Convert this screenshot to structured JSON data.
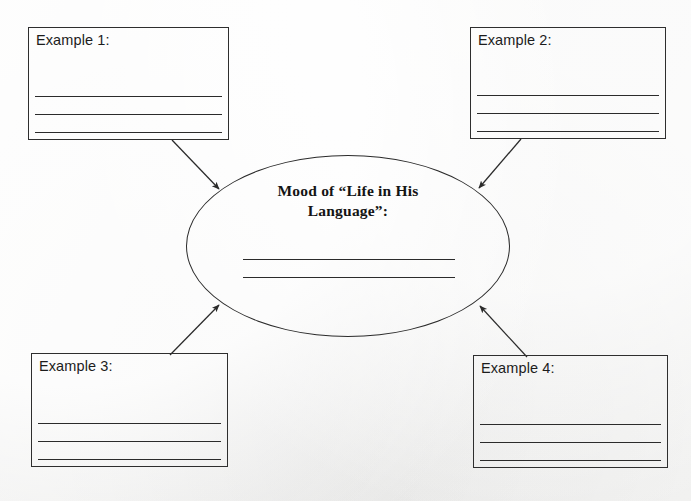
{
  "page": {
    "type": "graphic-organizer-worksheet",
    "background_color": "#f2f2f1",
    "ink_color": "#2b2b2b"
  },
  "center": {
    "shape": "ellipse",
    "title_line_1": "Mood of “Life in His",
    "title_line_2": "Language”:",
    "answer_line_count": 2
  },
  "boxes": [
    {
      "id": "example-1",
      "label": "Example 1:",
      "rule_line_count": 3
    },
    {
      "id": "example-2",
      "label": "Example 2:",
      "rule_line_count": 3
    },
    {
      "id": "example-3",
      "label": "Example 3:",
      "rule_line_count": 3
    },
    {
      "id": "example-4",
      "label": "Example 4:",
      "rule_line_count": 3
    }
  ],
  "connectors": [
    {
      "id": "arrow-from-example-1",
      "from": "example-1",
      "to": "center",
      "direction": "down-right"
    },
    {
      "id": "arrow-from-example-2",
      "from": "example-2",
      "to": "center",
      "direction": "down-left"
    },
    {
      "id": "arrow-from-example-3",
      "from": "example-3",
      "to": "center",
      "direction": "up-right"
    },
    {
      "id": "arrow-from-example-4",
      "from": "example-4",
      "to": "center",
      "direction": "up-left"
    }
  ]
}
